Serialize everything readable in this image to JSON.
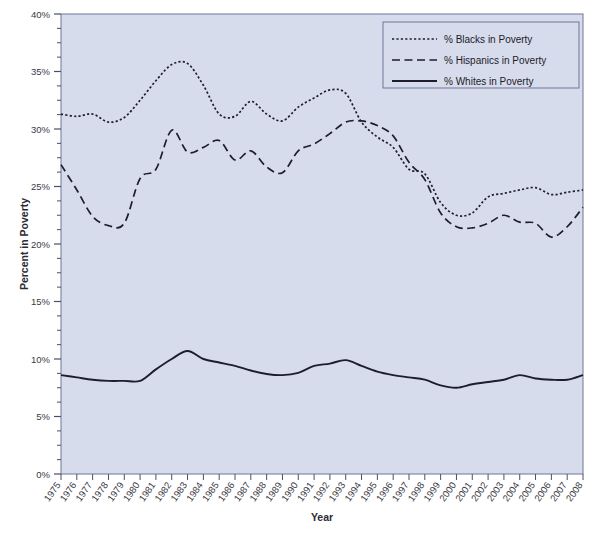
{
  "chart_data": {
    "type": "line",
    "title": "",
    "xlabel": "Year",
    "ylabel": "Percent in Poverty",
    "xlim": [
      1975,
      2008
    ],
    "ylim": [
      0,
      40
    ],
    "ytick_labels": [
      "0%",
      "5%",
      "10%",
      "15%",
      "20%",
      "25%",
      "30%",
      "35%",
      "40%"
    ],
    "ytick_values": [
      0,
      5,
      10,
      15,
      20,
      25,
      30,
      35,
      40
    ],
    "yminor_step": 1.25,
    "grid": false,
    "legend_position": "top-right",
    "plot_bgcolor": "#d7dcec",
    "figure_bgcolor": "#ffffff",
    "line_color": "#1d1d2e",
    "categories": [
      "1975",
      "1976",
      "1977",
      "1978",
      "1979",
      "1980",
      "1981",
      "1982",
      "1983",
      "1984",
      "1985",
      "1986",
      "1987",
      "1988",
      "1989",
      "1990",
      "1991",
      "1992",
      "1993",
      "1994",
      "1995",
      "1996",
      "1997",
      "1998",
      "1999",
      "2000",
      "2001",
      "2002",
      "2003",
      "2004",
      "2005",
      "2006",
      "2007",
      "2008"
    ],
    "series": [
      {
        "name": "% Blacks in Poverty",
        "style": "dotted",
        "values": [
          31.3,
          31.1,
          31.3,
          30.6,
          31.0,
          32.5,
          34.2,
          35.6,
          35.7,
          33.8,
          31.3,
          31.1,
          32.4,
          31.3,
          30.7,
          31.9,
          32.7,
          33.4,
          33.1,
          30.6,
          29.3,
          28.4,
          26.5,
          26.1,
          23.6,
          22.5,
          22.7,
          24.1,
          24.4,
          24.7,
          24.9,
          24.3,
          24.5,
          24.7
        ]
      },
      {
        "name": "% Hispanics in Poverty",
        "style": "dashed",
        "values": [
          26.9,
          24.7,
          22.4,
          21.6,
          21.8,
          25.7,
          26.5,
          29.9,
          28.0,
          28.4,
          29.0,
          27.3,
          28.1,
          26.7,
          26.2,
          28.1,
          28.7,
          29.6,
          30.6,
          30.7,
          30.3,
          29.4,
          27.1,
          25.6,
          22.7,
          21.5,
          21.4,
          21.8,
          22.5,
          21.9,
          21.8,
          20.6,
          21.5,
          23.2
        ]
      },
      {
        "name": "% Whites in Poverty",
        "style": "solid",
        "values": [
          8.6,
          8.4,
          8.2,
          8.1,
          8.1,
          8.1,
          9.1,
          10.0,
          10.7,
          10.0,
          9.7,
          9.4,
          9.0,
          8.7,
          8.6,
          8.8,
          9.4,
          9.6,
          9.9,
          9.4,
          8.9,
          8.6,
          8.4,
          8.2,
          7.7,
          7.5,
          7.8,
          8.0,
          8.2,
          8.6,
          8.3,
          8.2,
          8.2,
          8.6
        ]
      }
    ]
  },
  "legend": {
    "items": [
      {
        "label": "% Blacks in Poverty",
        "style": "dotted"
      },
      {
        "label": "% Hispanics in Poverty",
        "style": "dashed"
      },
      {
        "label": "% Whites in Poverty",
        "style": "solid"
      }
    ]
  }
}
